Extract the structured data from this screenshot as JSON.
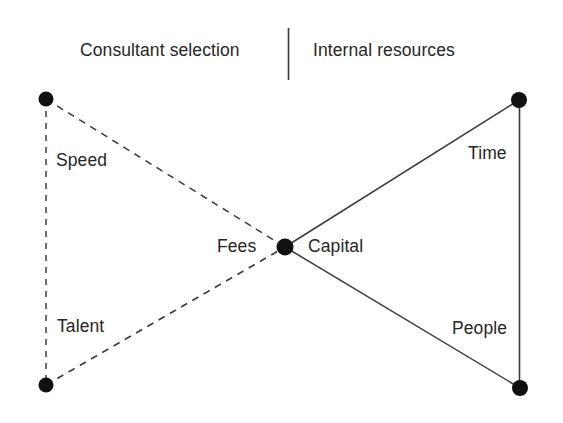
{
  "diagram": {
    "type": "bowtie-comparison-diagram",
    "headers": {
      "left": "Consultant selection",
      "right": "Internal resources"
    },
    "divider": {
      "name": "vertical-divider",
      "color": "#3a3a3a"
    },
    "colors": {
      "node": "#111111",
      "line": "#3a3a3a",
      "text": "#262626",
      "background": "#ffffff"
    },
    "nodes": [
      {
        "id": "top-left",
        "cx": 46,
        "cy": 99,
        "r": 7.5
      },
      {
        "id": "bottom-left",
        "cx": 46,
        "cy": 385,
        "r": 7.5
      },
      {
        "id": "center",
        "cx": 285,
        "cy": 247,
        "r": 8.5
      },
      {
        "id": "top-right",
        "cx": 519,
        "cy": 100,
        "r": 8.0
      },
      {
        "id": "bottom-right",
        "cx": 520,
        "cy": 388,
        "r": 8.0
      }
    ],
    "edges": [
      {
        "id": "left-vertical",
        "from": "top-left",
        "to": "bottom-left",
        "style": "dashed",
        "label": null
      },
      {
        "id": "speed-edge",
        "from": "top-left",
        "to": "center",
        "style": "dashed",
        "label": "Speed"
      },
      {
        "id": "talent-edge",
        "from": "bottom-left",
        "to": "center",
        "style": "dashed",
        "label": "Talent"
      },
      {
        "id": "time-edge",
        "from": "center",
        "to": "top-right",
        "style": "solid",
        "label": "Time"
      },
      {
        "id": "people-edge",
        "from": "center",
        "to": "bottom-right",
        "style": "solid",
        "label": "People"
      },
      {
        "id": "right-vertical",
        "from": "top-right",
        "to": "bottom-right",
        "style": "solid",
        "label": null
      }
    ],
    "labels": {
      "speed": "Speed",
      "talent": "Talent",
      "fees": "Fees",
      "capital": "Capital",
      "time": "Time",
      "people": "People"
    }
  }
}
